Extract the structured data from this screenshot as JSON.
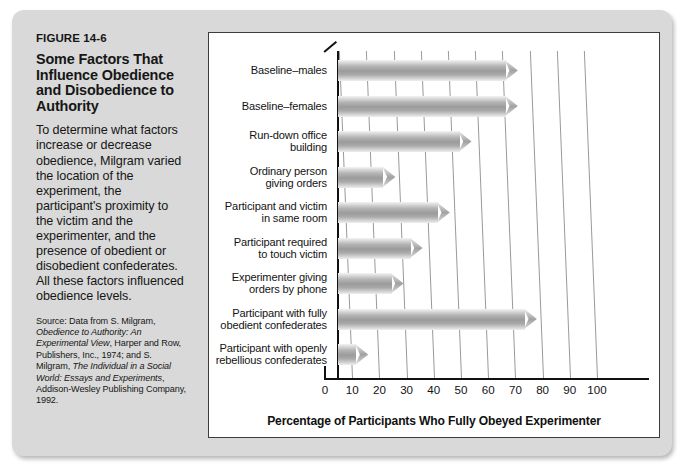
{
  "figure": {
    "number": "FIGURE 14-6",
    "title": "Some Factors That Influence Obedience and Disobedience to Authority",
    "description": "To determine what factors increase or decrease obedience, Milgram varied the location of the experiment, the participant's proximity to the victim and the experimenter, and the presence of obedient or disobedient confederates. All these factors influenced obedience levels.",
    "source_prefix": "Source: Data from S. Milgram, ",
    "source_italic_1": "Obedience to Authority: An Experimental View",
    "source_mid_1": ", Harper and Row, Publishers, Inc., 1974; and S. Milgram, ",
    "source_italic_2": "The Individual in a Social World: Essays and Experiments",
    "source_end": ", Addison-Wesley Publishing Company, 1992."
  },
  "chart_data": {
    "type": "bar",
    "orientation": "horizontal",
    "title": "Some Factors That Influence Obedience and Disobedience to Authority",
    "xlabel": "Percentage of Participants Who Fully Obeyed Experimenter",
    "ylabel": "",
    "xlim": [
      0,
      105
    ],
    "xticks": [
      0,
      10,
      20,
      30,
      40,
      50,
      60,
      70,
      80,
      90,
      100
    ],
    "grid": true,
    "legend": false,
    "categories": [
      "Baseline–males",
      "Baseline–females",
      "Run-down office building",
      "Ordinary person giving orders",
      "Participant and victim in same room",
      "Participant required to touch victim",
      "Experimenter giving orders by phone",
      "Participant with fully obedient confederates",
      "Participant with openly rebellious confederates"
    ],
    "category_lines": [
      [
        "Baseline–males"
      ],
      [
        "Baseline–females"
      ],
      [
        "Run-down office",
        "building"
      ],
      [
        "Ordinary person",
        "giving orders"
      ],
      [
        "Participant and victim",
        "in same room"
      ],
      [
        "Participant required",
        "to touch victim"
      ],
      [
        "Experimenter giving",
        "orders by phone"
      ],
      [
        "Participant with fully",
        "obedient confederates"
      ],
      [
        "Participant with openly",
        "rebellious confederates"
      ]
    ],
    "values": [
      65,
      65,
      48,
      20,
      40,
      30,
      23,
      72,
      10
    ]
  },
  "colors": {
    "card_background": "#d9d9d9",
    "panel_background": "#ffffff",
    "panel_border": "#3c3c3c",
    "bar_mid": "#9b9b9b",
    "gridline": "#9a9a9a",
    "axis": "#111111",
    "text": "#131313"
  }
}
